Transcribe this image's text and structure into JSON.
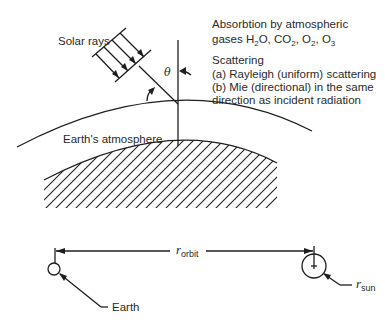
{
  "diagram": {
    "labels": {
      "solar_rays": "Solar rays",
      "theta": "θ",
      "atmosphere": "Earth's atmosphere",
      "absorption_line1": "Absorbtion by atmospheric",
      "absorption_line2_prefix": "gases H",
      "absorption_line2_parts": [
        {
          "base": "H",
          "sub": "2",
          "tail": "O, "
        },
        {
          "base": "CO",
          "sub": "2",
          "tail": ", "
        },
        {
          "base": "O",
          "sub": "2",
          "tail": ", "
        },
        {
          "base": "O",
          "sub": "3",
          "tail": ""
        }
      ],
      "scattering_title": "Scattering",
      "scattering_a": "(a) Rayleigh (uniform) scattering",
      "scattering_b_line1": "(b) Mie (directional) in the same",
      "scattering_b_line2": "direction as incident radiation",
      "r_orbit_base": "r",
      "r_orbit_sub": "orbit",
      "r_sun_base": "r",
      "r_sun_sub": "sun",
      "earth": "Earth"
    },
    "absorption_text": {
      "gases_label": "gases ",
      "h2o_base": "H",
      "h2o_sub": "2",
      "h2o_tail": "O, ",
      "co2_base": "CO",
      "co2_sub": "2",
      "co2_tail": ", ",
      "o2_base": "O",
      "o2_sub": "2",
      "o2_tail": ", ",
      "o3_base": "O",
      "o3_sub": "3"
    },
    "colors": {
      "line": "#1e1e1e",
      "text": "#2a2a2a",
      "background": "#ffffff"
    }
  }
}
